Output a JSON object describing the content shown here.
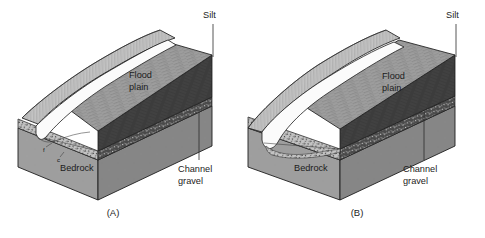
{
  "figure": {
    "background_color": "#ffffff",
    "width": 485,
    "height": 238,
    "caption_style": "parenthesized-letters"
  },
  "panels": [
    {
      "id": "panel-a",
      "letter": "(A)",
      "origin_x": 0,
      "labels": {
        "silt": "Silt",
        "flood_plain_line1": "Flood",
        "flood_plain_line2": "plain",
        "bedrock": "Bedrock",
        "channel_line1": "Channel",
        "channel_line2": "gravel",
        "fine_marker": "f",
        "coarse_marker": "c"
      },
      "description": "Block diagram of a valley with a narrow channel incised against the hillslope, floodplain underlain by channel gravel over bedrock"
    },
    {
      "id": "panel-b",
      "letter": "(B)",
      "origin_x": 243,
      "labels": {
        "silt": "Silt",
        "flood_plain_line1": "Flood",
        "flood_plain_line2": "plain",
        "bedrock": "Bedrock",
        "channel_line1": "Channel",
        "channel_line2": "gravel"
      },
      "description": "Block diagram of a valley with a wider channel and broader floodplain underlain by channel gravel over bedrock"
    }
  ],
  "materials": {
    "silt": {
      "name": "Silt",
      "color": "#3a3a3a"
    },
    "flood_plain": {
      "name": "Flood plain",
      "color": "#9a9a9a"
    },
    "channel_gravel": {
      "name": "Channel gravel",
      "color": "#b5b5b5"
    },
    "bedrock": {
      "name": "Bedrock",
      "color": "#9d9d9d"
    },
    "hillslope": {
      "name": "Hillslope",
      "color": "#c6c6c6"
    },
    "channel_water": {
      "name": "Channel",
      "color": "#fbfbfb"
    }
  }
}
